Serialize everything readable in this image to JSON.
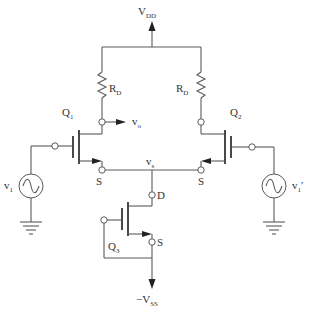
{
  "diagram": {
    "type": "differential-amplifier-schematic",
    "supply_positive": {
      "main": "V",
      "sub": "DD"
    },
    "supply_negative": {
      "main": "−V",
      "sub": "SS"
    },
    "resistor_left": {
      "main": "R",
      "sub": "D"
    },
    "resistor_right": {
      "main": "R",
      "sub": "D"
    },
    "transistor_1": {
      "main": "Q",
      "sub": "1"
    },
    "transistor_2": {
      "main": "Q",
      "sub": "2"
    },
    "transistor_3": {
      "main": "Q",
      "sub": "3"
    },
    "output": {
      "main": "v",
      "sub": "o"
    },
    "common_source_node": {
      "main": "v",
      "sub": "s"
    },
    "source_q1": "S",
    "source_q2": "S",
    "drain_q3": "D",
    "source_q3": "S",
    "input_left": {
      "main": "v",
      "sub": "1"
    },
    "input_right": {
      "main": "v",
      "sub": "1",
      "prime": "′"
    },
    "colors": {
      "wire": "#5a5a5a",
      "text": "#333333",
      "background": "#ffffff"
    }
  }
}
